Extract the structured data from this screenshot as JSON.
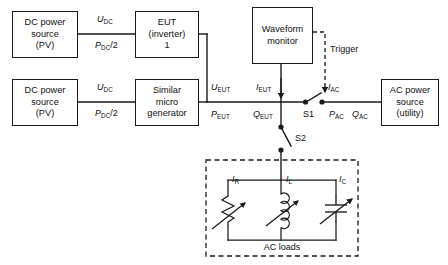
{
  "diagram": {
    "boxes": {
      "dc_source_1": {
        "line1": "DC power",
        "line2": "source",
        "line3": "(PV)"
      },
      "dc_source_2": {
        "line1": "DC power",
        "line2": "source",
        "line3": "(PV)"
      },
      "eut": {
        "line1": "EUT",
        "line2": "(inverter)",
        "line3": "1"
      },
      "micro_gen": {
        "line1": "Similar",
        "line2": "micro",
        "line3": "generator"
      },
      "waveform_monitor": {
        "line1": "Waveform",
        "line2": "monitor"
      },
      "ac_source": {
        "line1": "AC power",
        "line2": "source",
        "line3": "(utility)"
      }
    },
    "labels": {
      "u_dc_top": {
        "sym": "U",
        "sub": "DC"
      },
      "p_dc_top": {
        "sym": "P",
        "sub": "DC",
        "suffix": "/2"
      },
      "u_dc_bottom": {
        "sym": "U",
        "sub": "DC"
      },
      "p_dc_bottom": {
        "sym": "P",
        "sub": "DC",
        "suffix": "/2"
      },
      "u_eut": {
        "sym": "U",
        "sub": "EUT"
      },
      "p_eut": {
        "sym": "P",
        "sub": "EUT"
      },
      "i_eut": {
        "sym": "I",
        "sub": "EUT"
      },
      "q_eut": {
        "sym": "Q",
        "sub": "EUT"
      },
      "i_ac": {
        "sym": "I",
        "sub": "AC"
      },
      "p_ac": {
        "sym": "P",
        "sub": "AC"
      },
      "q_ac": {
        "sym": "Q",
        "sub": "AC"
      },
      "i_r": {
        "sym": "I",
        "sub": "R"
      },
      "i_l": {
        "sym": "I",
        "sub": "L"
      },
      "i_c": {
        "sym": "I",
        "sub": "C"
      },
      "trigger": "Trigger",
      "switch_s1": "S1",
      "switch_s2": "S2",
      "ac_loads": "AC loads"
    },
    "colors": {
      "line": "#1a1a1a",
      "text": "#111111",
      "background": "#ffffff"
    }
  }
}
